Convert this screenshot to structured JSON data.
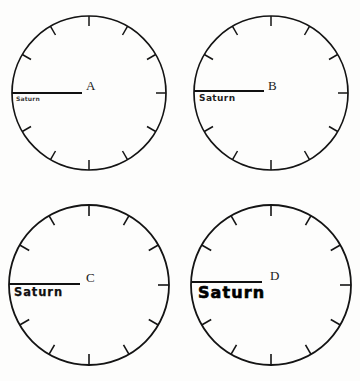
{
  "figure": {
    "title": "",
    "background_color": "#fdfdfc",
    "ink_color": "#141414",
    "panel_count": 4
  },
  "dial": {
    "tick_count": 12,
    "tick_angles_deg": [
      0,
      30,
      60,
      90,
      120,
      150,
      180,
      210,
      240,
      270,
      300,
      330
    ],
    "radius_line_angle_deg": 180,
    "radius_line_label": "radius-line-to-left-edge"
  },
  "panels": [
    {
      "id": "a",
      "letter": "A",
      "label": "Saturn",
      "label_size_rank": 1,
      "label_description": "smallest",
      "circle": {
        "cx": 89,
        "cy": 93,
        "r": 77
      },
      "letter_pos": {
        "x": 86,
        "y": 86
      },
      "label_pos": {
        "x": 16,
        "y": 96
      }
    },
    {
      "id": "b",
      "letter": "B",
      "label": "Saturn",
      "label_size_rank": 2,
      "label_description": "small",
      "circle": {
        "cx": 271,
        "cy": 93,
        "r": 77
      },
      "letter_pos": {
        "x": 268,
        "y": 86
      },
      "label_pos": {
        "x": 199,
        "y": 97
      }
    },
    {
      "id": "c",
      "letter": "C",
      "label": "Saturn",
      "label_size_rank": 3,
      "label_description": "medium",
      "circle": {
        "cx": 89,
        "cy": 285,
        "r": 80
      },
      "letter_pos": {
        "x": 86,
        "y": 278
      },
      "label_pos": {
        "x": 14,
        "y": 290
      }
    },
    {
      "id": "d",
      "letter": "D",
      "label": "Saturn",
      "label_size_rank": 4,
      "label_description": "largest",
      "circle": {
        "cx": 271,
        "cy": 285,
        "r": 80
      },
      "letter_pos": {
        "x": 270,
        "y": 277
      },
      "label_pos": {
        "x": 198,
        "y": 291
      }
    }
  ]
}
